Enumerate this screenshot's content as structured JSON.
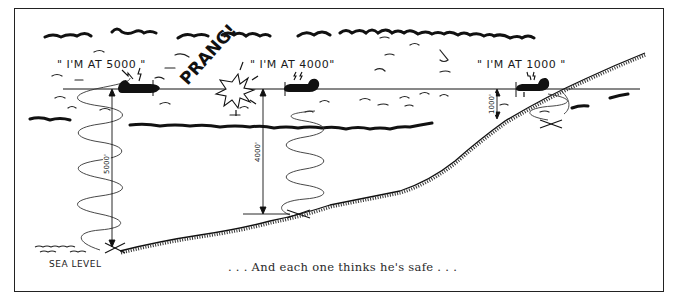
{
  "figure": {
    "title_caption": ". . . And each one thinks he's safe . . .",
    "impact_text": "PRANG!",
    "sea_level_label": "SEA LEVEL",
    "aircraft": [
      {
        "id": "plane-left",
        "quote": "\" I'M AT 5000 \"",
        "altimeter_reading": 5000,
        "dimension_label": "5000'"
      },
      {
        "id": "plane-middle",
        "quote": "\" I'M AT 4000\"",
        "altimeter_reading": 4000,
        "dimension_label": "4000'"
      },
      {
        "id": "plane-right",
        "quote": "\" I'M AT 1000 \"",
        "altimeter_reading": 1000,
        "dimension_label": "1000'"
      }
    ],
    "colors": {
      "ink": "#1a1a1a",
      "background": "#ffffff",
      "caption": "#2a2a2a"
    }
  }
}
